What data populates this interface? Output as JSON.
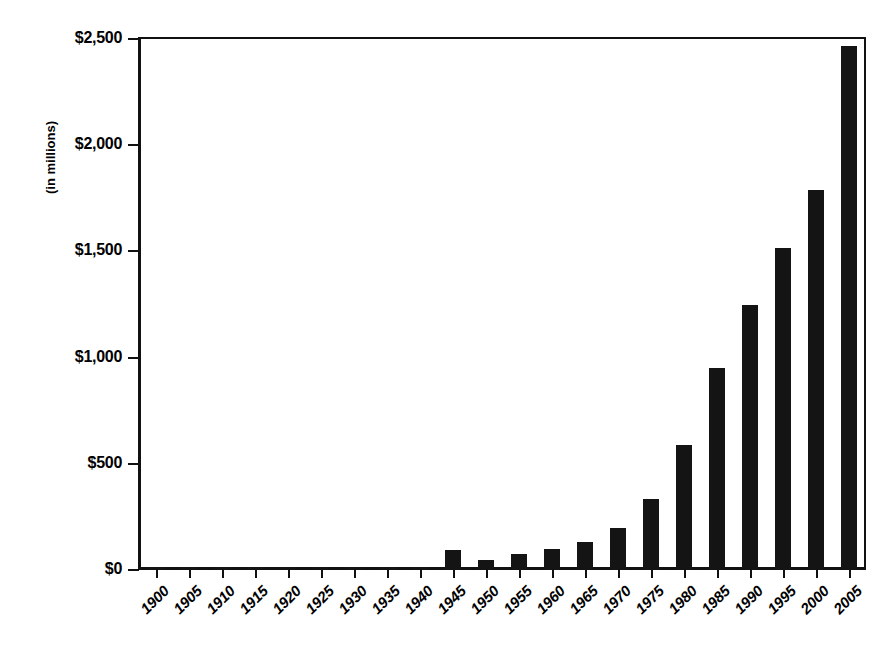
{
  "chart_data": {
    "type": "bar",
    "title": "",
    "xlabel": "",
    "ylabel": "(in millions)",
    "ylim": [
      0,
      2500
    ],
    "ytick_labels": [
      "$0",
      "$500",
      "$1,000",
      "$1,500",
      "$2,000",
      "$2,500"
    ],
    "ytick_values": [
      0,
      500,
      1000,
      1500,
      2000,
      2500
    ],
    "grid": false,
    "legend": null,
    "bar_color": "#141414",
    "categories": [
      "1900",
      "1905",
      "1910",
      "1915",
      "1920",
      "1925",
      "1930",
      "1935",
      "1940",
      "1945",
      "1950",
      "1955",
      "1960",
      "1965",
      "1970",
      "1975",
      "1980",
      "1985",
      "1990",
      "1995",
      "2000",
      "2005"
    ],
    "values": [
      5,
      5,
      5,
      5,
      5,
      5,
      5,
      5,
      15,
      95,
      45,
      75,
      100,
      130,
      200,
      335,
      590,
      950,
      1250,
      1515,
      1790,
      2465
    ]
  },
  "axis": {
    "y_title": "(in millions)"
  },
  "title_remnant": {
    "text": ""
  }
}
